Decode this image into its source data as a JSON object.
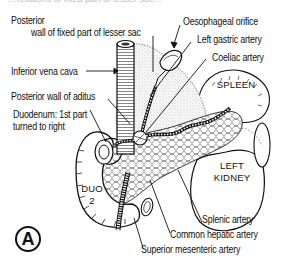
{
  "figure": {
    "panel_label": "A",
    "cropped_header_text": "…relations of fixed part of lesser sac…",
    "labels": {
      "posterior_wall_line1": "Posterior",
      "posterior_wall_line2": "wall of fixed part of lesser sac",
      "oesophageal_orifice": "Oesophageal orifice",
      "left_gastric_artery": "Left gastric artery",
      "coeliac_artery": "Coeliac artery",
      "inferior_vena_cava": "Inferior vena cava",
      "posterior_wall_aditus": "Posterior wall of aditus",
      "duodenum_line1": "Duodenum: 1st part",
      "duodenum_line2": "turned to right",
      "splenic_artery": "Splenic artery",
      "common_hepatic_artery": "Common hepatic artery",
      "superior_mesenteric_artery": "Superior mesenteric artery"
    },
    "organs": {
      "spleen": "SPLEEN",
      "left_kidney_line1": "LEFT",
      "left_kidney_line2": "KIDNEY",
      "duo_line1": "DUO",
      "duo_line2": "2"
    },
    "colors": {
      "ink": "#111111",
      "stipple": "#cfcfcf",
      "background": "#ffffff"
    }
  }
}
